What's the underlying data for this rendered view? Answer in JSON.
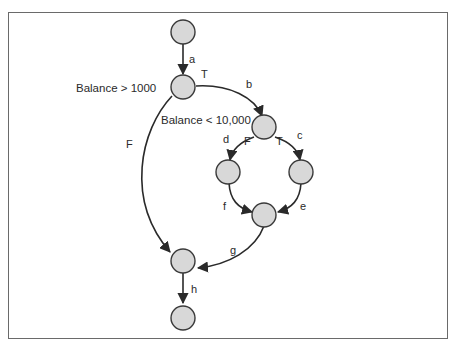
{
  "diagram": {
    "type": "control-flow-graph",
    "conditions": {
      "outer": "Balance > 1000",
      "inner": "Balance < 10,000"
    },
    "branch_labels": {
      "outer_true": "T",
      "outer_false": "F",
      "inner_true": "T",
      "inner_false": "F"
    },
    "edges": {
      "a": "a",
      "b": "b",
      "c": "c",
      "d": "d",
      "e": "e",
      "f": "f",
      "g": "g",
      "h": "h"
    },
    "colors": {
      "node_fill": "#d8d8d8",
      "node_stroke": "#3a3a3a",
      "edge": "#2a2a2a",
      "frame": "#6a6a6a"
    }
  }
}
